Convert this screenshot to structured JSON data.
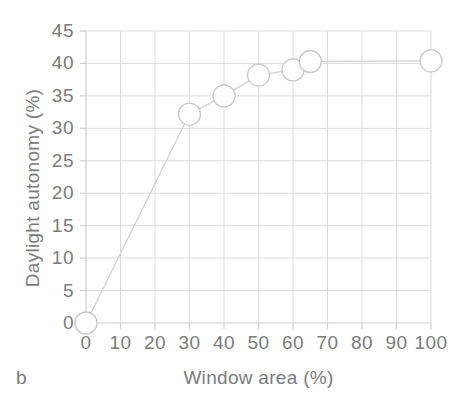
{
  "chart_data": {
    "type": "line",
    "title": "",
    "subtitle": "",
    "panel_label": "b",
    "xlabel": "Window area (%)",
    "ylabel": "Daylight autonomy (%)",
    "xlim": [
      0,
      100
    ],
    "ylim": [
      0,
      45
    ],
    "xticks": [
      0,
      10,
      20,
      30,
      40,
      50,
      60,
      70,
      80,
      90,
      100
    ],
    "yticks": [
      0,
      5,
      10,
      15,
      20,
      25,
      30,
      35,
      40,
      45
    ],
    "xtick_labels": [
      "0",
      "10",
      "20",
      "30",
      "40",
      "50",
      "60",
      "70",
      "80",
      "90",
      "100"
    ],
    "ytick_labels": [
      "0",
      "5",
      "10",
      "15",
      "20",
      "25",
      "30",
      "35",
      "40",
      "45"
    ],
    "grid": true,
    "legend": false,
    "legend_position": "none",
    "marker": "open-circle",
    "series": [
      {
        "name": "Daylight autonomy vs window area",
        "x": [
          0,
          30,
          40,
          50,
          60,
          65,
          100
        ],
        "values": [
          0,
          32.2,
          35.0,
          38.2,
          39.0,
          40.3,
          40.4
        ]
      }
    ],
    "colors": {
      "line": "#d2d2d2",
      "marker_stroke": "#c8c8c8",
      "marker_fill": "#ffffff",
      "grid": "#dcdcdc",
      "axis": "#cfcfcf",
      "text": "#7c7c7c",
      "background": "#ffffff"
    }
  }
}
